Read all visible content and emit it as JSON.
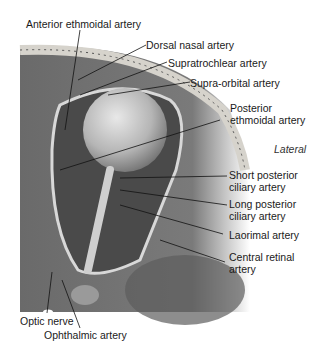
{
  "diagram": {
    "orientation_label": "Lateral",
    "labels": [
      {
        "id": "anterior-ethmoidal-artery",
        "text": "Anterior ethmoidal artery"
      },
      {
        "id": "dorsal-nasal-artery",
        "text": "Dorsal nasal artery"
      },
      {
        "id": "supratrochlear-artery",
        "text": "Supratrochlear artery"
      },
      {
        "id": "supra-orbital-artery",
        "text": "Supra-orbital artery"
      },
      {
        "id": "posterior-ethmoidal-artery",
        "line1": "Posterior",
        "line2": "ethmoidal artery"
      },
      {
        "id": "short-posterior-ciliary-artery",
        "line1": "Short posterior",
        "line2": "ciliary artery"
      },
      {
        "id": "long-posterior-ciliary-artery",
        "line1": "Long posterior",
        "line2": "ciliary artery"
      },
      {
        "id": "lacrimal-artery",
        "text": "Laorimal artery"
      },
      {
        "id": "central-retinal-artery",
        "line1": "Central retinal",
        "line2": "artery"
      },
      {
        "id": "optic-nerve",
        "text": "Optic nerve"
      },
      {
        "id": "ophthalmic-artery",
        "text": "Ophthalmic artery"
      }
    ]
  }
}
